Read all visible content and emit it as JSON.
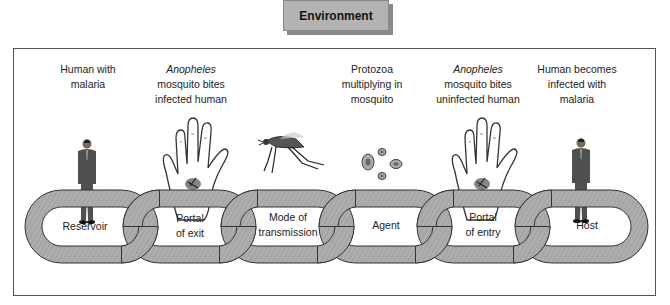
{
  "environment": {
    "label": "Environment"
  },
  "stages": [
    {
      "caption_italic": "",
      "caption": "Human with malaria",
      "caption_lines": [
        "Human with",
        "malaria"
      ],
      "icon": "person-icon"
    },
    {
      "caption_italic": "Anopheles",
      "caption": "mosquito bites infected human",
      "caption_lines": [
        "mosquito bites",
        "infected human"
      ],
      "icon": "hand-with-mosquito-icon"
    },
    {
      "caption_italic": "",
      "caption": "",
      "caption_lines": [],
      "icon": "mosquito-icon"
    },
    {
      "caption_italic": "",
      "caption": "Protozoa multiplying in mosquito",
      "caption_lines": [
        "Protozoa",
        "multiplying in",
        "mosquito"
      ],
      "icon": "protozoa-icon"
    },
    {
      "caption_italic": "Anopheles",
      "caption": "mosquito bites uninfected human",
      "caption_lines": [
        "mosquito bites",
        "uninfected human"
      ],
      "icon": "hand-with-mosquito-icon"
    },
    {
      "caption_italic": "",
      "caption": "Human becomes infected with malaria",
      "caption_lines": [
        "Human becomes",
        "infected with",
        "malaria"
      ],
      "icon": "person-icon"
    }
  ],
  "chain_links": [
    {
      "line1": "Reservoir",
      "line2": ""
    },
    {
      "line1": "Portal",
      "line2": "of exit"
    },
    {
      "line1": "Mode of",
      "line2": "transmission"
    },
    {
      "line1": "Agent",
      "line2": ""
    },
    {
      "line1": "Portal",
      "line2": "of entry"
    },
    {
      "line1": "Host",
      "line2": ""
    }
  ],
  "colors": {
    "link_fill": "#a9a9a9",
    "link_stroke": "#333333",
    "env_fill": "#b3b3b3",
    "frame": "#555555"
  }
}
